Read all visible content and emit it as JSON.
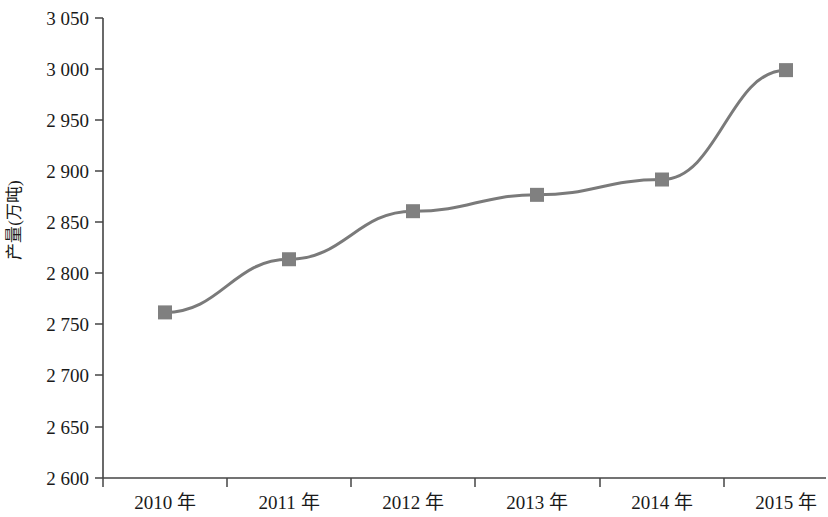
{
  "chart_data": {
    "type": "line",
    "title": "",
    "xlabel": "",
    "ylabel": "产量(万吨)",
    "categories": [
      "2010 年",
      "2011 年",
      "2012 年",
      "2013 年",
      "2014 年",
      "2015 年"
    ],
    "series": [
      {
        "name": "产量",
        "values": [
          2762,
          2814,
          2861,
          2877,
          2892,
          2999
        ],
        "line_color": "#7a7a7a",
        "marker_color": "#808080",
        "marker_shape": "square"
      }
    ],
    "ylim": [
      2600,
      3050
    ],
    "ytick_step": 50,
    "ytick_labels": [
      "3 050",
      "3 000",
      "2 950",
      "2 900",
      "2 850",
      "2 800",
      "2 750",
      "2 700",
      "2 650",
      "2 600"
    ],
    "ytick_values": [
      3050,
      3000,
      2950,
      2900,
      2850,
      2800,
      2750,
      2700,
      2650,
      2600
    ],
    "grid": false,
    "legend": false,
    "legend_position": "none",
    "axis_color": "#444444",
    "background": "#ffffff"
  }
}
